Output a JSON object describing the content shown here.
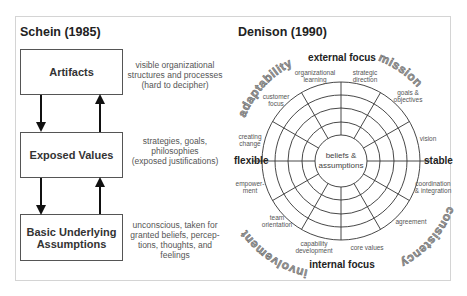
{
  "schein": {
    "title": "Schein (1985)",
    "levels": [
      {
        "label": "Artifacts",
        "description": [
          "visible organizational",
          "structures and processes",
          "(hard to decipher)"
        ]
      },
      {
        "label": "Exposed Values",
        "description": [
          "strategies, goals,",
          "philosophies",
          "(exposed justifications)"
        ]
      },
      {
        "label_lines": [
          "Basic Underlying",
          "Assumptions"
        ],
        "description": [
          "unconscious, taken for",
          "granted  beliefs, percep-",
          "tions, thoughts, and",
          "feelings"
        ]
      }
    ]
  },
  "denison": {
    "title": "Denison (1990)",
    "axes": {
      "top": "external focus",
      "bottom": "internal focus",
      "left": "flexible",
      "right": "stable"
    },
    "center": [
      "beliefs &",
      "assumptions"
    ],
    "traits": {
      "top_left": "adaptability",
      "top_right": "mission",
      "bottom_right": "consistency",
      "bottom_left": "involvement"
    },
    "indices": {
      "organizational_learning": [
        "organizational",
        "learning"
      ],
      "strategic_direction": [
        "strategic",
        "direction"
      ],
      "goals_objectives": [
        "goals &",
        "objectives"
      ],
      "vision": [
        "vision"
      ],
      "coordination_integration": [
        "coordination",
        "& integration"
      ],
      "agreement": [
        "agreement"
      ],
      "core_values": [
        "core values"
      ],
      "capability_development": [
        "capability",
        "development"
      ],
      "team_orientation": [
        "team",
        "orientation"
      ],
      "empowerment": [
        "empower-",
        "ment"
      ],
      "creating_change": [
        "creating",
        "change"
      ],
      "customer_focus": [
        "customer",
        "focus"
      ]
    },
    "colors": {
      "line": "#333333",
      "trait_text": "#8a8a8a",
      "index_text": "#666666"
    }
  }
}
